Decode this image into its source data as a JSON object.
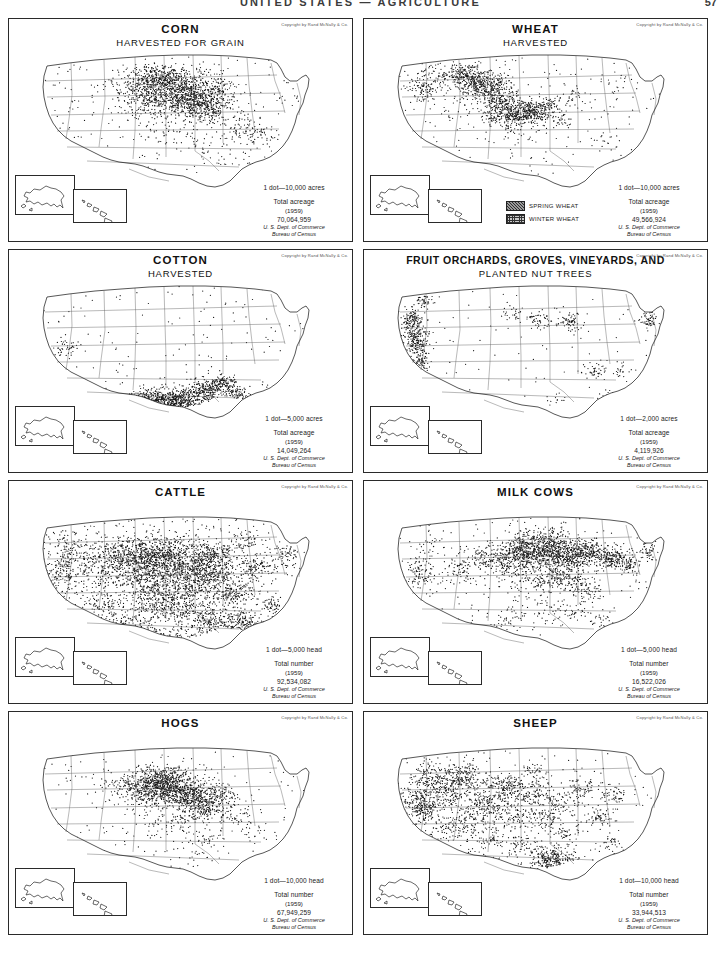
{
  "header": {
    "title": "UNITED STATES — AGRICULTURE",
    "page_number": "57"
  },
  "common": {
    "copyright": "Copyright by Rand McNally & Co.",
    "source_line1": "U. S. Dept. of Commerce",
    "source_line2": "Bureau of Census",
    "total_acreage_label": "Total acreage",
    "total_number_label": "Total number",
    "year": "(1959)"
  },
  "panels": [
    {
      "id": "corn",
      "title": "CORN",
      "subtitle": "HARVESTED FOR GRAIN",
      "unit": "1 dot—10,000 acres",
      "total_label": "Total acreage",
      "year": "(1959)",
      "total_value": "70,064,959",
      "dot_seed": 11,
      "dot_count": 2100,
      "density_profile": "corn"
    },
    {
      "id": "wheat",
      "title": "WHEAT",
      "subtitle": "HARVESTED",
      "unit": "1 dot—10,000 acres",
      "total_label": "Total acreage",
      "year": "(1959)",
      "total_value": "49,566,924",
      "dot_seed": 23,
      "dot_count": 1750,
      "density_profile": "wheat",
      "swatches": [
        {
          "label": "SPRING WHEAT",
          "pattern": "spring"
        },
        {
          "label": "WINTER WHEAT",
          "pattern": "winter"
        }
      ]
    },
    {
      "id": "cotton",
      "title": "COTTON",
      "subtitle": "HARVESTED",
      "unit": "1 dot—5,000 acres",
      "total_label": "Total acreage",
      "year": "(1959)",
      "total_value": "14,049,264",
      "dot_seed": 37,
      "dot_count": 1250,
      "density_profile": "cotton"
    },
    {
      "id": "fruit",
      "title": "FRUIT ORCHARDS, GROVES, VINEYARDS, AND",
      "subtitle": "PLANTED NUT TREES",
      "unit": "1 dot—2,000 acres",
      "total_label": "Total acreage",
      "year": "(1959)",
      "total_value": "4,119,926",
      "dot_seed": 53,
      "dot_count": 900,
      "density_profile": "fruit"
    },
    {
      "id": "cattle",
      "title": "CATTLE",
      "subtitle": "",
      "unit": "1 dot—5,000 head",
      "total_label": "Total number",
      "year": "(1959)",
      "total_value": "92,534,082",
      "dot_seed": 71,
      "dot_count": 4200,
      "density_profile": "cattle"
    },
    {
      "id": "milk-cows",
      "title": "MILK COWS",
      "subtitle": "",
      "unit": "1 dot—5,000 head",
      "total_label": "Total number",
      "year": "(1959)",
      "total_value": "16,522,026",
      "dot_seed": 89,
      "dot_count": 2600,
      "density_profile": "milkcows"
    },
    {
      "id": "hogs",
      "title": "HOGS",
      "subtitle": "",
      "unit": "1 dot—10,000 head",
      "total_label": "Total number",
      "year": "(1959)",
      "total_value": "67,949,259",
      "dot_seed": 103,
      "dot_count": 1900,
      "density_profile": "hogs"
    },
    {
      "id": "sheep",
      "title": "SHEEP",
      "subtitle": "",
      "unit": "1 dot—10,000 head",
      "total_label": "Total number",
      "year": "(1959)",
      "total_value": "33,944,513",
      "dot_seed": 127,
      "dot_count": 2400,
      "density_profile": "sheep"
    }
  ],
  "colors": {
    "ink": "#1a1a1a",
    "border": "#2a2a2a",
    "dot": "#141414",
    "paper": "#ffffff"
  }
}
